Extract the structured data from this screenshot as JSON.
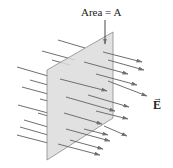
{
  "diagram": {
    "area_label": "Area = A",
    "field_label": "E",
    "field_vector_mark": "→",
    "colors": {
      "plane_fill": "#dcdcdc",
      "plane_edge": "#8a8a8a",
      "field_line": "#6f6f6f",
      "text": "#222222"
    }
  }
}
